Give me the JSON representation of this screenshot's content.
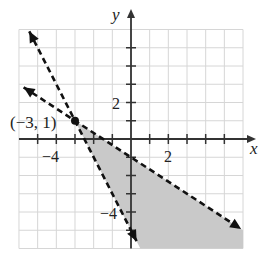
{
  "chart_data": {
    "type": "line",
    "title": "",
    "xlabel": "x",
    "ylabel": "y",
    "xlim": [
      -6,
      6
    ],
    "ylim": [
      -6,
      6
    ],
    "grid": true,
    "x_tick_labels": [
      {
        "value": -4,
        "label": "−4"
      },
      {
        "value": 2,
        "label": "2"
      }
    ],
    "y_tick_labels": [
      {
        "value": 2,
        "label": "2"
      },
      {
        "value": -4,
        "label": "−4"
      }
    ],
    "series": [
      {
        "name": "boundary-steep",
        "equation": "y = -2x - 5",
        "style": "dashed",
        "slope": -2,
        "intercept": -5,
        "x_range": [
          -5.45,
          0.3
        ]
      },
      {
        "name": "boundary-shallow",
        "equation": "y = -(2/3)x - 1",
        "style": "dashed",
        "slope": -0.6667,
        "intercept": -1,
        "x_range": [
          -5.75,
          5.9
        ]
      }
    ],
    "shaded_region": {
      "description": "Region below y = -(2/3)x - 1 and to the right of y = -2x - 5",
      "color": "#c8c8c8"
    },
    "points": [
      {
        "x": -3,
        "y": 1,
        "label": "(−3, 1)"
      }
    ]
  },
  "labels": {
    "x_axis": "x",
    "y_axis": "y",
    "point": "(−3, 1)",
    "xtick_neg4": "−4",
    "xtick_2": "2",
    "ytick_2": "2",
    "ytick_neg4": "−4"
  }
}
